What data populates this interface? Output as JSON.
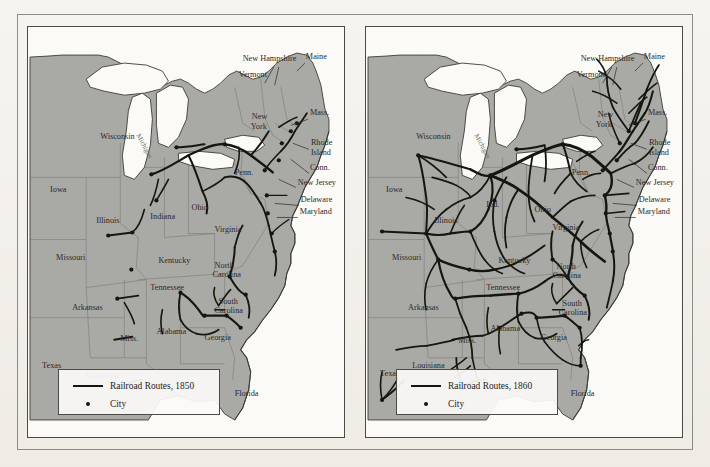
{
  "figure": {
    "kind": "historical-map-pair",
    "panels": [
      {
        "id": "map-1850",
        "year": "1850",
        "legend": {
          "route_label": "Railroad Routes, 1850",
          "city_label": "City"
        },
        "state_labels": [
          {
            "name": "Wisconsin",
            "x": 72,
            "y": 112,
            "rot": 0
          },
          {
            "name": "Iowa",
            "x": 22,
            "y": 165,
            "rot": 0
          },
          {
            "name": "Illinois",
            "x": 68,
            "y": 196,
            "rot": 0
          },
          {
            "name": "Missouri",
            "x": 28,
            "y": 232,
            "rot": 0
          },
          {
            "name": "Indiana",
            "x": 122,
            "y": 192,
            "rot": 0
          },
          {
            "name": "Ohio",
            "x": 163,
            "y": 183,
            "rot": 0
          },
          {
            "name": "Kentucky",
            "x": 130,
            "y": 235,
            "rot": 0
          },
          {
            "name": "Tennessee",
            "x": 122,
            "y": 262,
            "rot": 0
          },
          {
            "name": "Arkansas",
            "x": 44,
            "y": 282,
            "rot": 0
          },
          {
            "name": "Miss.",
            "x": 92,
            "y": 313,
            "rot": 0
          },
          {
            "name": "Alabama",
            "x": 128,
            "y": 306,
            "rot": 0
          },
          {
            "name": "Georgia",
            "x": 176,
            "y": 312,
            "rot": 0
          },
          {
            "name": "Louisiana",
            "x": 58,
            "y": 350,
            "rot": 0
          },
          {
            "name": "Texas",
            "x": 14,
            "y": 340,
            "rot": 0
          },
          {
            "name": "Florida",
            "x": 206,
            "y": 368,
            "rot": 0
          },
          {
            "name": "North",
            "x": 186,
            "y": 240,
            "rot": 0
          },
          {
            "name": "Carolina",
            "x": 184,
            "y": 249,
            "rot": 0
          },
          {
            "name": "South",
            "x": 190,
            "y": 276,
            "rot": 0
          },
          {
            "name": "Carolina",
            "x": 186,
            "y": 285,
            "rot": 0
          },
          {
            "name": "Virginia",
            "x": 186,
            "y": 205,
            "rot": 0
          },
          {
            "name": "Penn.",
            "x": 206,
            "y": 148,
            "rot": 0
          },
          {
            "name": "New",
            "x": 223,
            "y": 92,
            "rot": 0
          },
          {
            "name": "York",
            "x": 222,
            "y": 102,
            "rot": 0
          },
          {
            "name": "Vermont",
            "x": 210,
            "y": 50,
            "rot": 0
          },
          {
            "name": "New Hampshire",
            "x": 214,
            "y": 34,
            "rot": 0
          },
          {
            "name": "Maine",
            "x": 277,
            "y": 32,
            "rot": 0
          },
          {
            "name": "Mass.",
            "x": 281,
            "y": 88,
            "rot": 0
          },
          {
            "name": "Rhode",
            "x": 282,
            "y": 118,
            "rot": 0
          },
          {
            "name": "Island",
            "x": 282,
            "y": 128,
            "rot": 0
          },
          {
            "name": "Conn.",
            "x": 281,
            "y": 143,
            "rot": 0
          },
          {
            "name": "New Jersey",
            "x": 269,
            "y": 158,
            "rot": 0
          },
          {
            "name": "Delaware",
            "x": 272,
            "y": 175,
            "rot": 0
          },
          {
            "name": "Maryland",
            "x": 271,
            "y": 187,
            "rot": 0
          },
          {
            "name": "Michigan",
            "x": 108,
            "y": 108,
            "rot": 62
          }
        ],
        "cities": [
          {
            "x": 80,
            "y": 208
          },
          {
            "x": 104,
            "y": 205
          },
          {
            "x": 103,
            "y": 242
          },
          {
            "x": 89,
            "y": 271
          },
          {
            "x": 152,
            "y": 265
          },
          {
            "x": 123,
            "y": 147
          },
          {
            "x": 148,
            "y": 120
          },
          {
            "x": 128,
            "y": 173
          },
          {
            "x": 176,
            "y": 288
          },
          {
            "x": 198,
            "y": 288
          },
          {
            "x": 212,
            "y": 300
          },
          {
            "x": 201,
            "y": 249
          },
          {
            "x": 217,
            "y": 267
          },
          {
            "x": 96,
            "y": 358
          },
          {
            "x": 238,
            "y": 168
          },
          {
            "x": 239,
            "y": 186
          },
          {
            "x": 243,
            "y": 206
          },
          {
            "x": 246,
            "y": 224
          },
          {
            "x": 236,
            "y": 143
          },
          {
            "x": 253,
            "y": 116
          },
          {
            "x": 262,
            "y": 104
          },
          {
            "x": 268,
            "y": 96
          },
          {
            "x": 250,
            "y": 133
          },
          {
            "x": 196,
            "y": 117
          }
        ]
      },
      {
        "id": "map-1860",
        "year": "1860",
        "legend": {
          "route_label": "Railroad Routes, 1860",
          "city_label": "City"
        },
        "state_labels": [
          {
            "name": "Wisconsin",
            "x": 50,
            "y": 112,
            "rot": 0
          },
          {
            "name": "Iowa",
            "x": 20,
            "y": 165,
            "rot": 0
          },
          {
            "name": "Illinois",
            "x": 68,
            "y": 196,
            "rot": 0
          },
          {
            "name": "Missouri",
            "x": 26,
            "y": 232,
            "rot": 0
          },
          {
            "name": "Ind.",
            "x": 120,
            "y": 180,
            "rot": 0
          },
          {
            "name": "Ohio",
            "x": 168,
            "y": 185,
            "rot": 0
          },
          {
            "name": "Kentucky",
            "x": 132,
            "y": 235,
            "rot": 0
          },
          {
            "name": "Tennessee",
            "x": 120,
            "y": 262,
            "rot": 0
          },
          {
            "name": "Arkansas",
            "x": 42,
            "y": 282,
            "rot": 0
          },
          {
            "name": "Miss.",
            "x": 92,
            "y": 315,
            "rot": 0
          },
          {
            "name": "Alabama",
            "x": 124,
            "y": 303,
            "rot": 0
          },
          {
            "name": "Georgia",
            "x": 174,
            "y": 312,
            "rot": 0
          },
          {
            "name": "Louisiana",
            "x": 46,
            "y": 340,
            "rot": 0
          },
          {
            "name": "Texas",
            "x": 14,
            "y": 348,
            "rot": 0
          },
          {
            "name": "Florida",
            "x": 204,
            "y": 368,
            "rot": 0
          },
          {
            "name": "North",
            "x": 190,
            "y": 241,
            "rot": 0
          },
          {
            "name": "Carolina",
            "x": 186,
            "y": 250,
            "rot": 0
          },
          {
            "name": "South",
            "x": 196,
            "y": 278,
            "rot": 0
          },
          {
            "name": "Carolina",
            "x": 192,
            "y": 287,
            "rot": 0
          },
          {
            "name": "Virginia",
            "x": 186,
            "y": 203,
            "rot": 0
          },
          {
            "name": "Penn.",
            "x": 205,
            "y": 148,
            "rot": 0
          },
          {
            "name": "New",
            "x": 231,
            "y": 90,
            "rot": 0
          },
          {
            "name": "York",
            "x": 229,
            "y": 100,
            "rot": 0
          },
          {
            "name": "Vermont",
            "x": 210,
            "y": 50,
            "rot": 0
          },
          {
            "name": "New Hampshire",
            "x": 214,
            "y": 34,
            "rot": 0
          },
          {
            "name": "Maine",
            "x": 277,
            "y": 32,
            "rot": 0
          },
          {
            "name": "Mass.",
            "x": 281,
            "y": 88,
            "rot": 0
          },
          {
            "name": "Rhode",
            "x": 282,
            "y": 118,
            "rot": 0
          },
          {
            "name": "Island",
            "x": 282,
            "y": 128,
            "rot": 0
          },
          {
            "name": "Conn.",
            "x": 281,
            "y": 143,
            "rot": 0
          },
          {
            "name": "New Jersey",
            "x": 269,
            "y": 158,
            "rot": 0
          },
          {
            "name": "Delaware",
            "x": 272,
            "y": 175,
            "rot": 0
          },
          {
            "name": "Maryland",
            "x": 271,
            "y": 187,
            "rot": 0
          },
          {
            "name": "Michigan",
            "x": 108,
            "y": 108,
            "rot": 62
          }
        ],
        "cities": [
          {
            "x": 52,
            "y": 128
          },
          {
            "x": 16,
            "y": 204
          },
          {
            "x": 60,
            "y": 206
          },
          {
            "x": 72,
            "y": 232
          },
          {
            "x": 104,
            "y": 204
          },
          {
            "x": 103,
            "y": 242
          },
          {
            "x": 89,
            "y": 271
          },
          {
            "x": 152,
            "y": 266
          },
          {
            "x": 124,
            "y": 148
          },
          {
            "x": 150,
            "y": 122
          },
          {
            "x": 128,
            "y": 173
          },
          {
            "x": 170,
            "y": 290
          },
          {
            "x": 198,
            "y": 288
          },
          {
            "x": 213,
            "y": 300
          },
          {
            "x": 201,
            "y": 250
          },
          {
            "x": 218,
            "y": 268
          },
          {
            "x": 96,
            "y": 360
          },
          {
            "x": 16,
            "y": 372
          },
          {
            "x": 214,
            "y": 338
          },
          {
            "x": 238,
            "y": 168
          },
          {
            "x": 239,
            "y": 186
          },
          {
            "x": 243,
            "y": 206
          },
          {
            "x": 246,
            "y": 224
          },
          {
            "x": 236,
            "y": 143
          },
          {
            "x": 253,
            "y": 116
          },
          {
            "x": 262,
            "y": 104
          },
          {
            "x": 268,
            "y": 96
          },
          {
            "x": 250,
            "y": 133
          },
          {
            "x": 196,
            "y": 117
          },
          {
            "x": 186,
            "y": 232
          },
          {
            "x": 133,
            "y": 300
          },
          {
            "x": 155,
            "y": 286
          }
        ]
      }
    ],
    "colors": {
      "page_background": "#f3f1ec",
      "land_fill": "#a9a9a6",
      "water_fill": "#fbfaf7",
      "lake_fill": "#fbfaf7",
      "state_border": "#77776f",
      "coast_outline": "#3c3c38",
      "railroad": "#16160f",
      "city_dot": "#16160f",
      "frame": "#4a4a47",
      "outer_frame": "#8d8d88",
      "label_text": "#2a2a28"
    }
  }
}
